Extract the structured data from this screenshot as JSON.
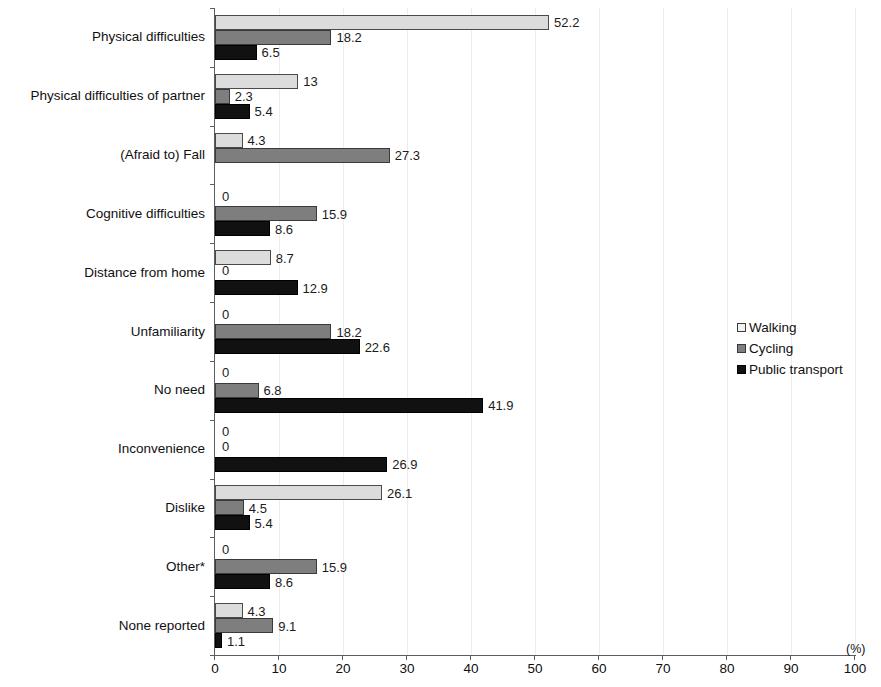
{
  "chart_data": {
    "type": "bar",
    "orientation": "horizontal",
    "title": "",
    "xlabel": "(%)",
    "ylabel": "",
    "xlim": [
      0,
      100
    ],
    "xticks": [
      0,
      10,
      20,
      30,
      40,
      50,
      60,
      70,
      80,
      90,
      100
    ],
    "grid": true,
    "legend_position": "right",
    "categories": [
      "Physical difficulties",
      "Physical difficulties of partner",
      "(Afraid to) Fall",
      "Cognitive difficulties",
      "Distance from home",
      "Unfamiliarity",
      "No need",
      "Inconvenience",
      "Dislike",
      "Other*",
      "None reported"
    ],
    "series": [
      {
        "name": "Walking",
        "color": "#dcdcdc",
        "values": [
          52.2,
          13,
          4.3,
          0,
          8.7,
          0,
          0,
          0,
          26.1,
          0,
          4.3
        ],
        "labels": [
          "52.2",
          "13",
          "4.3",
          "0",
          "8.7",
          "0",
          "0",
          "0",
          "26.1",
          "0",
          "4.3"
        ]
      },
      {
        "name": "Cycling",
        "color": "#7e7e7e",
        "values": [
          18.2,
          2.3,
          27.3,
          15.9,
          0,
          18.2,
          6.8,
          0,
          4.5,
          15.9,
          9.1
        ],
        "labels": [
          "18.2",
          "2.3",
          "27.3",
          "15.9",
          "0",
          "18.2",
          "6.8",
          "0",
          "4.5",
          "15.9",
          "9.1"
        ]
      },
      {
        "name": "Public transport",
        "color": "#111111",
        "values": [
          6.5,
          5.4,
          0,
          8.6,
          12.9,
          22.6,
          41.9,
          26.9,
          5.4,
          8.6,
          1.1
        ],
        "labels": [
          "6.5",
          "5.4",
          "",
          "8.6",
          "12.9",
          "22.6",
          "41.9",
          "26.9",
          "5.4",
          "8.6",
          "1.1"
        ]
      }
    ]
  },
  "legend": {
    "items": [
      {
        "label": "Walking",
        "key": "walking"
      },
      {
        "label": "Cycling",
        "key": "cycling"
      },
      {
        "label": "Public transport",
        "key": "transport"
      }
    ]
  },
  "axis": {
    "unit_label": "(%)"
  }
}
